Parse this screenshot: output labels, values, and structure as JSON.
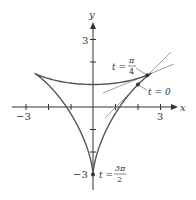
{
  "diagram": {
    "axes": {
      "x_label": "x",
      "y_label": "y"
    },
    "ticks": {
      "x_neg": "−3",
      "x_pos": "3",
      "y_pos": "3",
      "y_neg": "−3"
    },
    "annotations": {
      "t_pi4_lhs": "t =",
      "t_pi4_num": "π",
      "t_pi4_den": "4",
      "t_0": "t = 0",
      "t_3pi2_lhs": "t =",
      "t_3pi2_num": "3π",
      "t_3pi2_den": "2"
    },
    "curve_color": "#555555",
    "axis_color": "#333333",
    "tangent_color": "#888888"
  }
}
